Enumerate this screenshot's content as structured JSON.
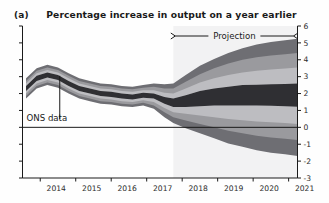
{
  "figure": {
    "panel_label": "(a)",
    "title": "Percentage increase in output on a year earlier"
  },
  "annotations": {
    "projection_label": "Projection",
    "ons_label": "ONS data"
  },
  "colors": {
    "band_1_darkest": "#2f2f33",
    "band_2": "#6e6e73",
    "band_3": "#9a9a9e",
    "band_4": "#bdbdc1",
    "band_5": "#d6d6d9",
    "band_6_lightest": "#e9e9eb",
    "projection_backdrop": "#f2f2f3",
    "axis": "#1a1a1a",
    "zero_line": "#1a1a1a",
    "text": "#1a1a1a"
  },
  "chart_data": {
    "type": "area",
    "title": "Percentage increase in output on a year earlier",
    "subtitle": "(a)",
    "xlabel": "",
    "ylabel": "",
    "xlim": [
      2013.5,
      2021.25
    ],
    "ylim": [
      -3,
      6
    ],
    "yticks": [
      6,
      5,
      4,
      3,
      2,
      1,
      0,
      -1,
      -2,
      -3
    ],
    "ytick_labels": [
      "6",
      "5",
      "4",
      "3",
      "2",
      "1",
      "0",
      "-1",
      "-2",
      "-3"
    ],
    "xticks": [
      2014,
      2015,
      2016,
      2017,
      2018,
      2019,
      2020,
      2021
    ],
    "xtick_labels": [
      "2014",
      "2015",
      "2016",
      "2017",
      "2018",
      "2019",
      "2020",
      "2021"
    ],
    "grid": false,
    "legend": "none",
    "zero_line": 0,
    "projection_start": 2017.75,
    "annotations": [
      {
        "text": "Projection",
        "type": "double-arrow-span",
        "x_start": 2017.75,
        "x_end": 2021.25,
        "y": 5.6
      },
      {
        "text": "ONS data",
        "type": "leader-line",
        "x_label": 2013.9,
        "y_label": 0.55,
        "x_point": 2014.55,
        "y_point": 3.05
      }
    ],
    "x": [
      2013.6,
      2013.9,
      2014.2,
      2014.5,
      2014.8,
      2015.1,
      2015.4,
      2015.7,
      2016.0,
      2016.3,
      2016.6,
      2016.9,
      2017.2,
      2017.5,
      2017.75,
      2018.1,
      2018.5,
      2018.9,
      2019.3,
      2019.7,
      2020.1,
      2020.5,
      2020.9,
      2021.25
    ],
    "central_line": [
      2.3,
      2.9,
      3.1,
      2.95,
      2.6,
      2.3,
      2.15,
      2.0,
      1.95,
      1.85,
      1.8,
      1.9,
      1.85,
      1.6,
      1.45,
      1.55,
      1.7,
      1.8,
      1.85,
      1.9,
      1.9,
      1.9,
      1.9,
      1.9
    ],
    "bands": [
      {
        "name": "30% probability band",
        "percent": 30,
        "lower": [
          2.15,
          2.75,
          2.95,
          2.8,
          2.45,
          2.15,
          2.0,
          1.85,
          1.8,
          1.7,
          1.65,
          1.75,
          1.7,
          1.4,
          1.2,
          1.2,
          1.25,
          1.3,
          1.3,
          1.3,
          1.3,
          1.28,
          1.25,
          1.22
        ],
        "upper": [
          2.45,
          3.05,
          3.25,
          3.1,
          2.75,
          2.45,
          2.3,
          2.15,
          2.1,
          2.0,
          1.95,
          2.05,
          2.0,
          1.8,
          1.7,
          1.9,
          2.15,
          2.3,
          2.4,
          2.5,
          2.52,
          2.55,
          2.57,
          2.6
        ]
      },
      {
        "name": "50% probability band",
        "percent": 50,
        "lower": [
          2.0,
          2.6,
          2.8,
          2.65,
          2.3,
          2.0,
          1.85,
          1.7,
          1.65,
          1.55,
          1.5,
          1.6,
          1.5,
          1.15,
          0.9,
          0.8,
          0.7,
          0.6,
          0.5,
          0.42,
          0.35,
          0.3,
          0.25,
          0.2
        ],
        "upper": [
          2.6,
          3.2,
          3.4,
          3.25,
          2.9,
          2.6,
          2.45,
          2.3,
          2.25,
          2.15,
          2.1,
          2.2,
          2.2,
          2.05,
          2.0,
          2.3,
          2.65,
          2.9,
          3.1,
          3.25,
          3.35,
          3.42,
          3.48,
          3.55
        ]
      },
      {
        "name": "70% probability band",
        "percent": 70,
        "lower": [
          1.85,
          2.45,
          2.65,
          2.5,
          2.15,
          1.85,
          1.7,
          1.55,
          1.5,
          1.4,
          1.35,
          1.45,
          1.3,
          0.9,
          0.6,
          0.4,
          0.2,
          0.0,
          -0.2,
          -0.35,
          -0.5,
          -0.6,
          -0.68,
          -0.75
        ],
        "upper": [
          2.75,
          3.35,
          3.55,
          3.4,
          3.05,
          2.75,
          2.6,
          2.45,
          2.4,
          2.3,
          2.25,
          2.35,
          2.4,
          2.3,
          2.3,
          2.7,
          3.15,
          3.5,
          3.78,
          4.0,
          4.15,
          4.25,
          4.33,
          4.4
        ]
      },
      {
        "name": "90% probability band",
        "percent": 90,
        "lower": [
          1.7,
          2.3,
          2.5,
          2.35,
          2.0,
          1.7,
          1.55,
          1.4,
          1.35,
          1.25,
          1.2,
          1.3,
          1.1,
          0.6,
          0.25,
          -0.05,
          -0.35,
          -0.65,
          -0.95,
          -1.15,
          -1.35,
          -1.5,
          -1.6,
          -1.7
        ],
        "upper": [
          2.9,
          3.5,
          3.7,
          3.55,
          3.2,
          2.9,
          2.75,
          2.6,
          2.55,
          2.45,
          2.4,
          2.5,
          2.6,
          2.55,
          2.6,
          3.1,
          3.65,
          4.05,
          4.4,
          4.68,
          4.9,
          5.05,
          5.15,
          5.25
        ]
      }
    ]
  }
}
